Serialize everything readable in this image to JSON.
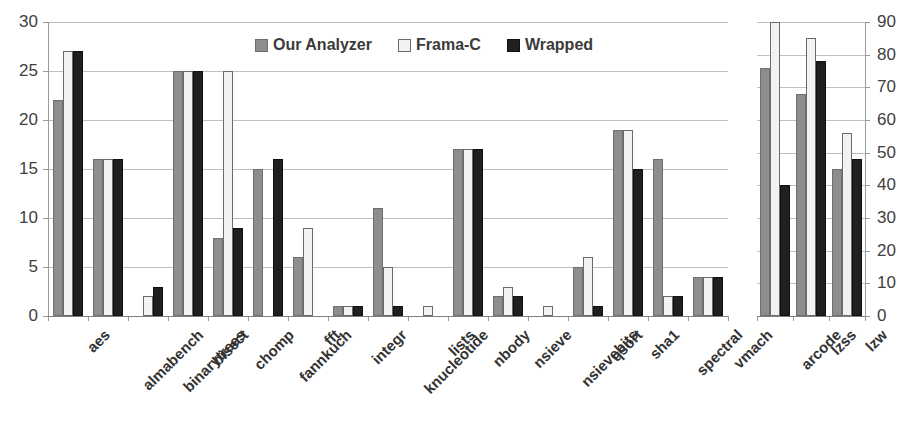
{
  "chart_data": [
    {
      "id": "left-panel",
      "type": "bar",
      "title": "",
      "xlabel": "",
      "ylabel": "",
      "ylim": [
        0,
        30
      ],
      "yticks": [
        0,
        5,
        10,
        15,
        20,
        25,
        30
      ],
      "grid": true,
      "legend_position": "top-center",
      "categories": [
        "aes",
        "almabench",
        "binarytrees",
        "bisect",
        "chomp",
        "fannkuch",
        "fft",
        "integr",
        "knucleotide",
        "lists",
        "nbody",
        "nsieve",
        "nsievebits",
        "qsort",
        "sha1",
        "spectral",
        "vmach"
      ],
      "series": [
        {
          "name": "Our Analyzer",
          "color": "#8d8d8d",
          "values": [
            22,
            16,
            0,
            25,
            8,
            15,
            6,
            1,
            11,
            0,
            17,
            2,
            0,
            5,
            19,
            16,
            4
          ]
        },
        {
          "name": "Frama-C",
          "color": "#f2f2f2",
          "values": [
            27,
            16,
            2,
            25,
            25,
            0,
            9,
            1,
            5,
            1,
            17,
            3,
            1,
            6,
            19,
            2,
            4
          ]
        },
        {
          "name": "Wrapped",
          "color": "#1f1f1f",
          "values": [
            27,
            16,
            3,
            25,
            9,
            16,
            0,
            1,
            1,
            0,
            17,
            2,
            0,
            1,
            15,
            2,
            4
          ]
        }
      ]
    },
    {
      "id": "right-panel",
      "type": "bar",
      "title": "",
      "xlabel": "",
      "ylabel": "",
      "ylim": [
        0,
        90
      ],
      "yticks": [
        0,
        10,
        20,
        30,
        40,
        50,
        60,
        70,
        80,
        90
      ],
      "grid": true,
      "y_axis_side": "right",
      "categories": [
        "arcode",
        "lzss",
        "lzw"
      ],
      "series": [
        {
          "name": "Our Analyzer",
          "color": "#8d8d8d",
          "values": [
            76,
            68,
            45
          ]
        },
        {
          "name": "Frama-C",
          "color": "#f2f2f2",
          "values": [
            90,
            85,
            56
          ]
        },
        {
          "name": "Wrapped",
          "color": "#1f1f1f",
          "values": [
            40,
            78,
            48
          ]
        }
      ]
    }
  ],
  "legend": {
    "items": [
      {
        "label": "Our Analyzer",
        "swatch": "legend-swatch-our-analyzer"
      },
      {
        "label": "Frama-C",
        "swatch": "legend-swatch-frama-c"
      },
      {
        "label": "Wrapped",
        "swatch": "legend-swatch-wrapped"
      }
    ]
  }
}
